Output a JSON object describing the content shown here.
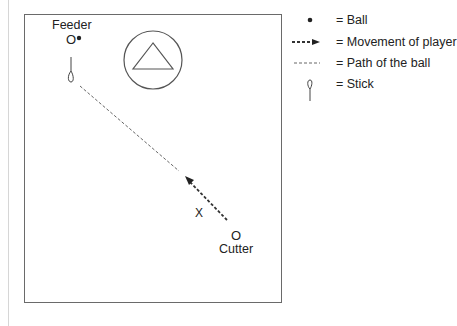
{
  "diagram": {
    "players": {
      "feeder": {
        "label": "Feeder",
        "marker": "O"
      },
      "cutter": {
        "label": "Cutter",
        "marker": "O"
      },
      "defender": {
        "marker": "X"
      }
    },
    "goal": {
      "shape": "circle-with-triangle"
    }
  },
  "legend": {
    "items": [
      {
        "symbol": "ball-icon",
        "label": "= Ball"
      },
      {
        "symbol": "movement-arrow-icon",
        "label": "= Movement of player"
      },
      {
        "symbol": "dashed-path-icon",
        "label": "= Path of the ball"
      },
      {
        "symbol": "stick-icon",
        "label": "= Stick"
      }
    ]
  },
  "colors": {
    "line": "#444444",
    "border": "#6a6a6a",
    "text": "#222222"
  }
}
